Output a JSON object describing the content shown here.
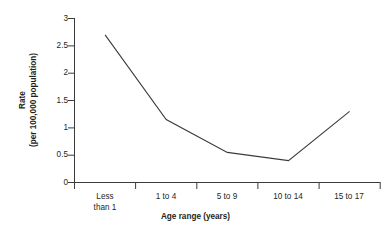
{
  "chart_data": {
    "type": "line",
    "title": "",
    "subtitle": "",
    "xlabel": "Age range (years)",
    "ylabel": "Rate\n(per 100,000 population)",
    "ylabel_line1": "Rate",
    "ylabel_line2": "(per 100,000 population)",
    "categories": [
      "Less than 1",
      "1 to 4",
      "5 to 9",
      "10 to 14",
      "15 to 17"
    ],
    "category_lines": [
      [
        "Less",
        "than 1"
      ],
      [
        "1 to 4"
      ],
      [
        "5 to 9"
      ],
      [
        "10 to 14"
      ],
      [
        "15 to 17"
      ]
    ],
    "values": [
      2.7,
      1.15,
      0.55,
      0.4,
      1.3
    ],
    "series": [
      {
        "name": "Rate per 100,000 population",
        "values": [
          2.7,
          1.15,
          0.55,
          0.4,
          1.3
        ]
      }
    ],
    "ylim": [
      0,
      3
    ],
    "yticks": [
      0,
      0.5,
      1,
      1.5,
      2,
      2.5,
      3
    ],
    "ytick_labels": [
      "0",
      "0.5",
      "1",
      "1.5",
      "2",
      "2.5",
      "3"
    ],
    "grid": false,
    "legend": false,
    "legend_position": "none",
    "annotations": [],
    "line_color": "#3b3b3b",
    "axis_color": "#3b3b3b",
    "background_color": "#ffffff",
    "category_labels_between_ticks": true
  }
}
